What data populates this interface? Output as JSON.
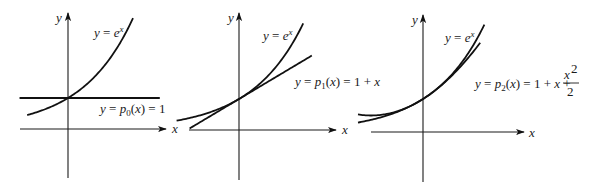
{
  "figure": {
    "panels": [
      {
        "id": "p0",
        "axis_labels": {
          "x": "x",
          "y": "y"
        },
        "curve_label": "y = e^x",
        "approx_label": "y = p0(x) = 1",
        "approx_label_parts": {
          "prefix": "y = ",
          "p": "p",
          "sub": "0",
          "suffix": "(x) = 1"
        },
        "origin_px": [
          68,
          129
        ],
        "scale_px": [
          51,
          31
        ],
        "x_axis_px": [
          20,
          160
        ],
        "y_axis_px": [
          14,
          178
        ],
        "exp_domain": [
          -0.8,
          1.275
        ],
        "approx_domain": [
          -0.95,
          1.8
        ],
        "approx_degree": 0
      },
      {
        "id": "p1",
        "axis_labels": {
          "x": "x",
          "y": "y"
        },
        "curve_label": "y = e^x",
        "approx_label": "y = p1(x) = 1 + x",
        "approx_label_parts": {
          "prefix": "y = ",
          "p": "p",
          "sub": "1",
          "suffix": "(x) = 1 + x"
        },
        "origin_px": [
          239,
          130
        ],
        "scale_px": [
          52,
          31
        ],
        "x_axis_px": [
          189,
          330
        ],
        "y_axis_px": [
          14,
          180
        ],
        "exp_domain": [
          -1.2,
          1.235
        ],
        "approx_domain": [
          -0.95,
          1.4
        ],
        "approx_degree": 1
      },
      {
        "id": "p2",
        "axis_labels": {
          "x": "x",
          "y": "y"
        },
        "curve_label": "y = e^x",
        "approx_label": "y = p2(x) = 1 + x + x^2/2",
        "approx_label_parts": {
          "prefix": "y = ",
          "p": "p",
          "sub": "2",
          "suffix": "(x) = 1 + x + ",
          "frac_num": "x",
          "frac_num_sup": "2",
          "frac_den": "2"
        },
        "origin_px": [
          423,
          132
        ],
        "scale_px": [
          52,
          33
        ],
        "x_axis_px": [
          371,
          523
        ],
        "y_axis_px": [
          14,
          182
        ],
        "exp_domain": [
          -1.25,
          1.18
        ],
        "approx_domain": [
          -1.25,
          1.1
        ],
        "approx_degree": 2
      }
    ]
  },
  "chart_data": {
    "type": "line",
    "xlabel": "x",
    "ylabel": "y",
    "grid": false,
    "panels": [
      {
        "series": [
          {
            "name": "y = e^x",
            "fn": "exp(x)"
          },
          {
            "name": "y = p0(x) = 1",
            "fn": "1"
          }
        ],
        "tangent_point": [
          0,
          1
        ]
      },
      {
        "series": [
          {
            "name": "y = e^x",
            "fn": "exp(x)"
          },
          {
            "name": "y = p1(x) = 1 + x",
            "fn": "1 + x"
          }
        ],
        "tangent_point": [
          0,
          1
        ]
      },
      {
        "series": [
          {
            "name": "y = e^x",
            "fn": "exp(x)"
          },
          {
            "name": "y = p2(x) = 1 + x + x^2/2",
            "fn": "1 + x + x^2/2"
          }
        ],
        "tangent_point": [
          0,
          1
        ]
      }
    ]
  }
}
